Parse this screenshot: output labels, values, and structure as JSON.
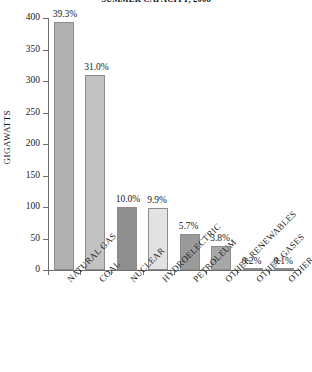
{
  "chart_data": {
    "type": "bar",
    "title": "SUMMER CAPACITY, 2008",
    "xlabel": "",
    "ylabel": "GIGAWATTS",
    "ylim": [
      0,
      400
    ],
    "yticks": [
      0,
      50,
      100,
      150,
      200,
      250,
      300,
      350,
      400
    ],
    "grid": false,
    "legend": null,
    "categories": [
      "NATURAL GAS",
      "COAL",
      "NUCLEAR",
      "HYDROELECTRIC",
      "PETROLEUM",
      "OTHER RENEWABLES",
      "OTHER GASES",
      "OTHER"
    ],
    "values": [
      393,
      310,
      100,
      99,
      57,
      38,
      2,
      1
    ],
    "data_labels": [
      "39.3%",
      "31.0%",
      "10.0%",
      "9.9%",
      "5.7%",
      "3.8%",
      "0.2%",
      "0.1%"
    ],
    "bar_colors": [
      "#b0b0b0",
      "#c2c2c2",
      "#8f8f8f",
      "#e2e2e2",
      "#9a9a9a",
      "#a8a8a8",
      "#8f8f8f",
      "#8f8f8f"
    ]
  }
}
